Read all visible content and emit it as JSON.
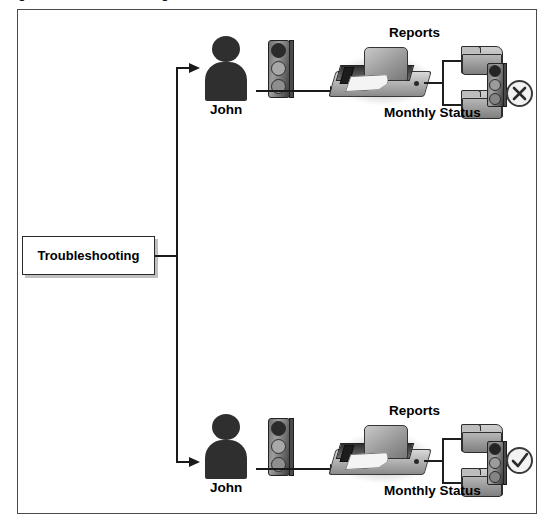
{
  "figure": {
    "caption": "Figure 11-5:    Troubleshooting Problems with NTFS Permissions"
  },
  "diagram": {
    "root": {
      "label": "Troubleshooting"
    },
    "branches": [
      {
        "id": "scenario-denied",
        "actor_label": "John",
        "actor_icon": "person-icon",
        "gate_icon": "traffic-light-icon",
        "flow_icon": "arrow-right-icon",
        "resource_icon": "computer-icon",
        "resource_top_label": "Reports",
        "resource_bottom_label": "Monthly Status",
        "folders": [
          "folder-icon",
          "folder-icon"
        ],
        "folder_gate_icon": "traffic-light-icon",
        "status_icon": "circle-x-icon",
        "status_meaning": "denied"
      },
      {
        "id": "scenario-allowed",
        "actor_label": "John",
        "actor_icon": "person-icon",
        "gate_icon": "traffic-light-icon",
        "flow_icon": "arrow-right-icon",
        "resource_icon": "computer-icon",
        "resource_top_label": "Reports",
        "resource_bottom_label": "Monthly Status",
        "folders": [
          "folder-icon",
          "folder-icon"
        ],
        "folder_gate_icon": "traffic-light-icon",
        "status_icon": "circle-check-icon",
        "status_meaning": "allowed"
      }
    ]
  },
  "colors": {
    "background": "#ffffff",
    "frame_border": "#4a4a4a",
    "connector": "#1a1a1a",
    "text": "#000000",
    "icon_dark": "#2f2f2f",
    "icon_mid": "#9d9d9d"
  }
}
